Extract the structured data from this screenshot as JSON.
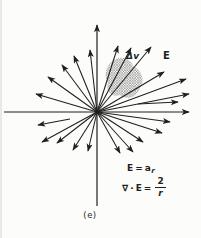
{
  "figure": {
    "caption": "(e)",
    "labels": {
      "delta_v": "Δv",
      "field_vector": "E"
    },
    "equations": {
      "line1": {
        "lhs": "E",
        "rel": "=",
        "base": "a",
        "sub": "r"
      },
      "line2": {
        "nabla": "∇",
        "dot": "·",
        "E": "E",
        "rel": "=",
        "num": "2",
        "den": "r"
      }
    }
  },
  "diagram": {
    "colors": {
      "ink": "#1f1f1f",
      "paper": "#fcfcfa",
      "hatch": "#606060"
    },
    "center": [
      97,
      112
    ],
    "axes": {
      "horizontal": {
        "from": [
          4,
          112
        ],
        "to": [
          189,
          112
        ]
      },
      "vertical": {
        "from": [
          97,
          206
        ],
        "to": [
          97,
          25
        ]
      }
    },
    "delta_v_region": {
      "path": "M113,61 C120,55 130,58 133,66 C141,70 146,80 140,88 C137,97 127,101 120,95 C112,98 105,91 108,83 C103,75 106,66 113,61 Z"
    },
    "arrows": [
      {
        "to": [
          90,
          50
        ]
      },
      {
        "to": [
          74,
          56
        ]
      },
      {
        "to": [
          62,
          65
        ]
      },
      {
        "to": [
          48,
          77
        ]
      },
      {
        "to": [
          36,
          94
        ]
      },
      {
        "to": [
          118,
          46
        ]
      },
      {
        "to": [
          131,
          48
        ]
      },
      {
        "to": [
          151,
          47
        ]
      },
      {
        "to": [
          164,
          72
        ]
      },
      {
        "to": [
          186,
          79
        ]
      },
      {
        "to": [
          189,
          94
        ]
      },
      {
        "from": [
          138,
          104
        ],
        "to": [
          178,
          102
        ]
      },
      {
        "to": [
          170,
          122
        ]
      },
      {
        "to": [
          162,
          133
        ]
      },
      {
        "to": [
          143,
          142
        ]
      },
      {
        "to": [
          133,
          152
        ]
      },
      {
        "to": [
          120,
          153
        ]
      },
      {
        "to": [
          88,
          151
        ]
      },
      {
        "to": [
          73,
          150
        ]
      },
      {
        "to": [
          57,
          143
        ]
      },
      {
        "to": [
          42,
          142
        ]
      },
      {
        "from": [
          70,
          119
        ],
        "to": [
          38,
          125
        ]
      }
    ]
  }
}
